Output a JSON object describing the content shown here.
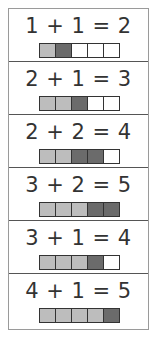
{
  "colors": {
    "first": "#bdbdbd",
    "second": "#6b6b6b",
    "empty": "#ffffff"
  },
  "rows": [
    {
      "equation": "1 + 1 = 2",
      "cells": [
        "first",
        "second",
        "empty",
        "empty",
        "empty"
      ]
    },
    {
      "equation": "2 + 1 = 3",
      "cells": [
        "first",
        "first",
        "second",
        "empty",
        "empty"
      ]
    },
    {
      "equation": "2 + 2 = 4",
      "cells": [
        "first",
        "first",
        "second",
        "second",
        "empty"
      ]
    },
    {
      "equation": "3 + 2 = 5",
      "cells": [
        "first",
        "first",
        "first",
        "second",
        "second"
      ]
    },
    {
      "equation": "3 + 1 = 4",
      "cells": [
        "first",
        "first",
        "first",
        "second",
        "empty"
      ]
    },
    {
      "equation": "4 + 1 = 5",
      "cells": [
        "first",
        "first",
        "first",
        "first",
        "second"
      ]
    }
  ]
}
